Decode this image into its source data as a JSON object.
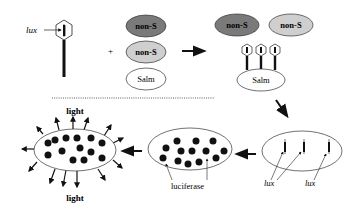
{
  "diagram": {
    "type": "phage-display luciferase reporter schematic",
    "colors": {
      "background": "#ffffff",
      "stroke": "#222222",
      "dark_cell_fill": "#7a7a7a",
      "light_cell_fill": "#cfcfcf",
      "salm_cell_fill": "#ffffff",
      "dot_fill": "#111111"
    },
    "top_row": {
      "phage_label": "lux",
      "plus_sign": "+",
      "cells": [
        {
          "label": "non-S",
          "shade": "dark"
        },
        {
          "label": "non-S",
          "shade": "light"
        },
        {
          "label": "Salm",
          "shade": "white"
        }
      ],
      "result_cells": [
        {
          "label": "non-S",
          "shade": "dark"
        },
        {
          "label": "non-S",
          "shade": "light"
        },
        {
          "label": "Salm",
          "shade": "white",
          "attached_phages": 3
        }
      ]
    },
    "bottom_row": {
      "infected_cell": {
        "labels": [
          "lux",
          "lux"
        ],
        "gene_count": 3
      },
      "expressing_cell": {
        "label": "luciferase",
        "dot_count": 14
      },
      "glowing_cell": {
        "labels": [
          "light",
          "light"
        ],
        "dot_count": 14,
        "ray_count": 14
      }
    },
    "arrows": [
      {
        "from": "mix",
        "to": "binding",
        "direction": "right"
      },
      {
        "from": "binding",
        "to": "infection",
        "direction": "down-right"
      },
      {
        "from": "infection",
        "to": "expression",
        "direction": "left"
      },
      {
        "from": "expression",
        "to": "light-emission",
        "direction": "left"
      }
    ],
    "separator": "dotted"
  }
}
